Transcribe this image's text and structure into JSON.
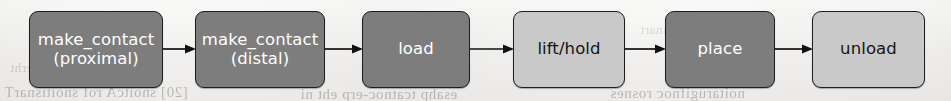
{
  "figure": {
    "kind": "pipeline-flow-diagram",
    "orientation": "left-to-right",
    "background_color": "#f4f3f1",
    "node_dark_color": "#7d7d7d",
    "node_light_color": "#c9c9c9",
    "node_border_color": "#1e1e1e",
    "arrow_color": "#111111"
  },
  "nodes": [
    {
      "id": "make-contact-proximal",
      "label": "make_contact",
      "sub": "(proximal)",
      "shade": "dark",
      "x": 29,
      "y": 11,
      "w": 134,
      "h": 77
    },
    {
      "id": "make-contact-distal",
      "label": "make_contact",
      "sub": "(distal)",
      "shade": "dark",
      "x": 195,
      "y": 11,
      "w": 130,
      "h": 77
    },
    {
      "id": "load",
      "label": "load",
      "sub": "",
      "shade": "dark",
      "x": 362,
      "y": 11,
      "w": 108,
      "h": 77
    },
    {
      "id": "lift-hold",
      "label": "lift/hold",
      "sub": "",
      "shade": "light",
      "x": 513,
      "y": 11,
      "w": 112,
      "h": 77
    },
    {
      "id": "place",
      "label": "place",
      "sub": "",
      "shade": "dark",
      "x": 665,
      "y": 11,
      "w": 110,
      "h": 77
    },
    {
      "id": "unload",
      "label": "unload",
      "sub": "",
      "shade": "light",
      "x": 812,
      "y": 11,
      "w": 113,
      "h": 77
    }
  ],
  "arrows": [
    {
      "id": "arrow-1",
      "from": "make-contact-proximal",
      "to": "make-contact-distal",
      "x": 163,
      "y": 42,
      "w": 33
    },
    {
      "id": "arrow-2",
      "from": "make-contact-distal",
      "to": "load",
      "x": 325,
      "y": 42,
      "w": 38
    },
    {
      "id": "arrow-3",
      "from": "load",
      "to": "lift-hold",
      "x": 470,
      "y": 42,
      "w": 44
    },
    {
      "id": "arrow-4",
      "from": "lift-hold",
      "to": "place",
      "x": 625,
      "y": 42,
      "w": 41
    },
    {
      "id": "arrow-5",
      "from": "place",
      "to": "unload",
      "x": 775,
      "y": 42,
      "w": 38
    }
  ],
  "background_artifacts": {
    "note": "faint mirrored bleed-through text from the reverse side of the scanned page",
    "lines": [
      "[20] snoitcA rof snoitisnarT",
      "esahp tcatnoc-erp eht ni",
      "noitarugifnoc rosnes",
      "]61[ dlohserht",
      "sisylana noitisnart"
    ]
  }
}
